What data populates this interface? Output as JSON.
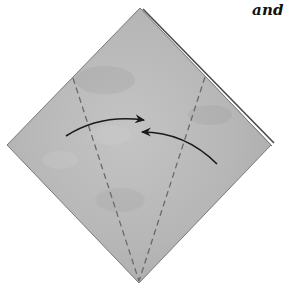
{
  "caption": {
    "text": "and s"
  },
  "diagram": {
    "paper": {
      "shape": "diamond",
      "fill": "#b8b8b8",
      "edge": "#6e6e6e",
      "layered_edge": "#4a4a4a",
      "points": {
        "top": [
          140,
          8
        ],
        "right": [
          271,
          145
        ],
        "bottom": [
          139,
          283
        ],
        "left": [
          7,
          145
        ]
      }
    },
    "fold_lines": [
      {
        "name": "left-valley-fold",
        "style": "dashed",
        "from": [
          73,
          78
        ],
        "to": [
          139,
          281
        ]
      },
      {
        "name": "right-valley-fold",
        "style": "dashed",
        "from": [
          205,
          77
        ],
        "to": [
          139,
          281
        ]
      }
    ],
    "arrows": [
      {
        "name": "fold-left-flap-arrow",
        "direction": "left-to-center",
        "from": [
          66,
          136
        ],
        "to": [
          145,
          120
        ]
      },
      {
        "name": "fold-right-flap-arrow",
        "direction": "right-to-center",
        "from": [
          217,
          164
        ],
        "to": [
          142,
          132
        ]
      }
    ],
    "colors": {
      "fold_line": "#6a6a6a",
      "arrow": "#1a1a1a"
    }
  }
}
